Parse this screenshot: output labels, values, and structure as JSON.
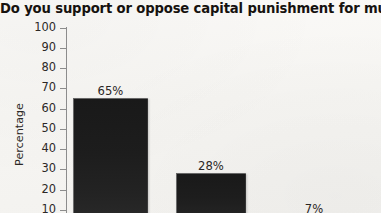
{
  "chart_data": {
    "type": "bar",
    "title": "Do you support or oppose capital punishment for murderers?",
    "xlabel": "",
    "ylabel": "Percentage",
    "ylim": [
      0,
      100
    ],
    "ytick_step": 10,
    "yticks": [
      100,
      90,
      80,
      70,
      60,
      50,
      40,
      30,
      20,
      10
    ],
    "ytick_labels": [
      "100",
      "90",
      "80",
      "70",
      "60",
      "50",
      "40",
      "30",
      "20",
      "10"
    ],
    "grid": false,
    "legend": null,
    "categories": [
      "",
      "",
      ""
    ],
    "values": [
      65,
      28,
      7
    ],
    "data_labels": [
      "65%",
      "28%",
      "7%"
    ],
    "bar_color": "#1d1d1d",
    "background_color": "#f8f7f5",
    "text_color": "#2c2826",
    "axis_color": "#8c8c8c",
    "note": "Bottom of plot area and category labels are cropped off below the image edge; third bar body not visible."
  },
  "axis": {
    "ticks": [
      {
        "label": "100",
        "value": 100
      },
      {
        "label": "90",
        "value": 90
      },
      {
        "label": "80",
        "value": 80
      },
      {
        "label": "70",
        "value": 70
      },
      {
        "label": "60",
        "value": 60
      },
      {
        "label": "50",
        "value": 50
      },
      {
        "label": "40",
        "value": 40
      },
      {
        "label": "30",
        "value": 30
      },
      {
        "label": "20",
        "value": 20
      },
      {
        "label": "10",
        "value": 10
      }
    ]
  },
  "bars": [
    {
      "label": "65%",
      "value": 65
    },
    {
      "label": "28%",
      "value": 28
    },
    {
      "label": "7%",
      "value": 7
    }
  ]
}
